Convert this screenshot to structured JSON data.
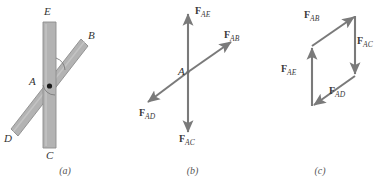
{
  "figure": {
    "type": "physics-diagram",
    "panels": [
      {
        "id": "a",
        "caption": "(a)",
        "description": "Two overlapping rigid bars pinned at joint A",
        "point_labels": [
          {
            "name": "E",
            "text": "E"
          },
          {
            "name": "B",
            "text": "B"
          },
          {
            "name": "A",
            "text": "A"
          },
          {
            "name": "D",
            "text": "D"
          },
          {
            "name": "C",
            "text": "C"
          }
        ],
        "colors": {
          "bar_fill": "#b3b3b3",
          "bar_stroke": "#8c8c8c",
          "pin": "#1a1a1a"
        }
      },
      {
        "id": "b",
        "caption": "(b)",
        "description": "Free-body diagram of pin A with four concurrent forces",
        "joint_label": "A",
        "vectors": [
          {
            "name": "F_AE",
            "f": "F",
            "sub": "AE",
            "direction": "up"
          },
          {
            "name": "F_AB",
            "f": "F",
            "sub": "AB",
            "direction": "up-right"
          },
          {
            "name": "F_AC",
            "f": "F",
            "sub": "AC",
            "direction": "down"
          },
          {
            "name": "F_AD",
            "f": "F",
            "sub": "AD",
            "direction": "down-left"
          }
        ],
        "colors": {
          "vector": "#7a7a7a"
        }
      },
      {
        "id": "c",
        "caption": "(c)",
        "description": "Force parallelogram formed by the four force vectors",
        "vectors": [
          {
            "name": "F_AB",
            "f": "F",
            "sub": "AB",
            "direction": "up-right"
          },
          {
            "name": "F_AC",
            "f": "F",
            "sub": "AC",
            "direction": "down"
          },
          {
            "name": "F_AE",
            "f": "F",
            "sub": "AE",
            "direction": "up"
          },
          {
            "name": "F_AD",
            "f": "F",
            "sub": "AD",
            "direction": "down-left"
          }
        ],
        "colors": {
          "vector": "#7a7a7a"
        }
      }
    ],
    "labels": {
      "a": {
        "E": "E",
        "B": "B",
        "A": "A",
        "D": "D",
        "C": "C",
        "caption": "(a)"
      },
      "b": {
        "A": "A",
        "FAE_f": "F",
        "FAE_sub": "AE",
        "FAB_f": "F",
        "FAB_sub": "AB",
        "FAC_f": "F",
        "FAC_sub": "AC",
        "FAD_f": "F",
        "FAD_sub": "AD",
        "caption": "(b)"
      },
      "c": {
        "FAB_f": "F",
        "FAB_sub": "AB",
        "FAC_f": "F",
        "FAC_sub": "AC",
        "FAE_f": "F",
        "FAE_sub": "AE",
        "FAD_f": "F",
        "FAD_sub": "AD",
        "caption": "(c)"
      }
    }
  }
}
